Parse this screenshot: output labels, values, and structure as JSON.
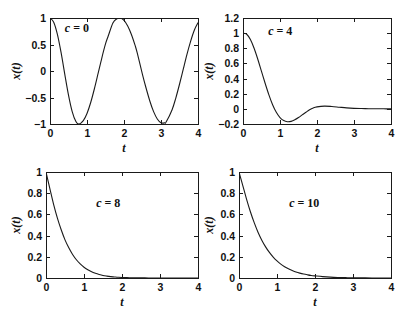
{
  "figure": {
    "background": "#ffffff",
    "curve_color": "#1a1a1a",
    "axis_color": "#1a1a1a",
    "width": 403,
    "height": 314
  },
  "chart_data": [
    {
      "type": "line",
      "title": "",
      "annotation": "c = 0",
      "annotation_var": "c",
      "annotation_rest": " = 0",
      "xlabel": "t",
      "ylabel": "x(t)",
      "xlim": [
        0,
        4
      ],
      "ylim": [
        -1,
        1
      ],
      "xticks": [
        0,
        1,
        2,
        3,
        4
      ],
      "xticklabels": [
        "0",
        "1",
        "2",
        "3",
        "4"
      ],
      "yticks": [
        -1,
        -0.5,
        0,
        0.5,
        1
      ],
      "yticklabels": [
        "-1",
        "-0.5",
        "0",
        "0.5",
        "1"
      ],
      "grid": false,
      "legend": "none",
      "series": [
        {
          "name": "x(t), c = 0",
          "description": "undamped cosine, period 1.571",
          "x": [
            0,
            0.1,
            0.2,
            0.3,
            0.4,
            0.5,
            0.6,
            0.7,
            0.785,
            0.9,
            1.0,
            1.1,
            1.2,
            1.3,
            1.4,
            1.5,
            1.571,
            1.7,
            1.8,
            1.9,
            2.0,
            2.1,
            2.2,
            2.3,
            2.356,
            2.5,
            2.6,
            2.7,
            2.8,
            2.9,
            3.0,
            3.1,
            3.142,
            3.3,
            3.4,
            3.5,
            3.6,
            3.7,
            3.8,
            3.9,
            4.0
          ],
          "y": [
            1.0,
            0.921,
            0.691,
            0.345,
            -0.063,
            -0.454,
            -0.765,
            -0.954,
            -1.0,
            -0.936,
            -0.801,
            -0.595,
            -0.335,
            -0.046,
            0.245,
            0.51,
            0.655,
            0.905,
            0.982,
            0.999,
            0.955,
            0.85,
            0.69,
            0.483,
            0.345,
            -0.067,
            -0.33,
            -0.57,
            -0.767,
            -0.905,
            -0.977,
            -0.978,
            -0.959,
            -0.73,
            -0.51,
            -0.25,
            0.03,
            0.31,
            0.56,
            0.77,
            0.91
          ]
        }
      ]
    },
    {
      "type": "line",
      "title": "",
      "annotation": "c = 4",
      "annotation_var": "c",
      "annotation_rest": " = 4",
      "xlabel": "t",
      "ylabel": "x(t)",
      "xlim": [
        0,
        4
      ],
      "ylim": [
        -0.2,
        1.2
      ],
      "xticks": [
        0,
        1,
        2,
        3,
        4
      ],
      "xticklabels": [
        "0",
        "1",
        "2",
        "3",
        "4"
      ],
      "yticks": [
        -0.2,
        0,
        0.2,
        0.4,
        0.6,
        0.8,
        1,
        1.2
      ],
      "yticklabels": [
        "-0.2",
        "0",
        "0.2",
        "0.4",
        "0.6",
        "0.8",
        "1",
        "1.2"
      ],
      "grid": false,
      "legend": "none",
      "series": [
        {
          "name": "x(t), c = 4",
          "description": "underdamped decay with one undershoot",
          "x": [
            0,
            0.1,
            0.2,
            0.3,
            0.4,
            0.5,
            0.6,
            0.7,
            0.8,
            0.9,
            1.0,
            1.1,
            1.2,
            1.3,
            1.4,
            1.5,
            1.6,
            1.7,
            1.8,
            1.9,
            2.0,
            2.2,
            2.4,
            2.6,
            2.8,
            3.0,
            3.2,
            3.4,
            3.6,
            3.8,
            4.0
          ],
          "y": [
            1.0,
            0.985,
            0.915,
            0.8,
            0.655,
            0.495,
            0.335,
            0.185,
            0.055,
            -0.045,
            -0.115,
            -0.155,
            -0.17,
            -0.165,
            -0.145,
            -0.115,
            -0.08,
            -0.045,
            -0.012,
            0.012,
            0.026,
            0.036,
            0.031,
            0.022,
            0.013,
            0.007,
            0.004,
            0.002,
            0.001,
            0.0005,
            0.0
          ]
        }
      ]
    },
    {
      "type": "line",
      "title": "",
      "annotation": "c = 8",
      "annotation_var": "c",
      "annotation_rest": " = 8",
      "xlabel": "t",
      "ylabel": "x(t)",
      "xlim": [
        0,
        4
      ],
      "ylim": [
        0,
        1
      ],
      "xticks": [
        0,
        1,
        2,
        3,
        4
      ],
      "xticklabels": [
        "0",
        "1",
        "2",
        "3",
        "4"
      ],
      "yticks": [
        0,
        0.2,
        0.4,
        0.6,
        0.8,
        1
      ],
      "yticklabels": [
        "0",
        "0.2",
        "0.4",
        "0.6",
        "0.8",
        "1"
      ],
      "grid": false,
      "legend": "none",
      "series": [
        {
          "name": "x(t), c = 8",
          "description": "critically damped monotone decay",
          "x": [
            0,
            0.1,
            0.2,
            0.3,
            0.4,
            0.5,
            0.6,
            0.7,
            0.8,
            0.9,
            1.0,
            1.1,
            1.2,
            1.3,
            1.4,
            1.5,
            1.6,
            1.7,
            1.8,
            1.9,
            2.0,
            2.2,
            2.4,
            2.6,
            2.8,
            3.0,
            3.5,
            4.0
          ],
          "y": [
            1.0,
            0.845,
            0.695,
            0.565,
            0.455,
            0.36,
            0.285,
            0.222,
            0.172,
            0.133,
            0.101,
            0.077,
            0.058,
            0.044,
            0.033,
            0.024,
            0.018,
            0.013,
            0.01,
            0.007,
            0.005,
            0.003,
            0.0015,
            0.0008,
            0.0004,
            0.0002,
            5e-05,
            0.0
          ]
        }
      ]
    },
    {
      "type": "line",
      "title": "",
      "annotation": "c = 10",
      "annotation_var": "c",
      "annotation_rest": " = 10",
      "xlabel": "t",
      "ylabel": "x(t)",
      "xlim": [
        0,
        4
      ],
      "ylim": [
        0,
        1
      ],
      "xticks": [
        0,
        1,
        2,
        3,
        4
      ],
      "xticklabels": [
        "0",
        "1",
        "2",
        "3",
        "4"
      ],
      "yticks": [
        0,
        0.2,
        0.4,
        0.6,
        0.8,
        1
      ],
      "yticklabels": [
        "0",
        "0.2",
        "0.4",
        "0.6",
        "0.8",
        "1"
      ],
      "grid": false,
      "legend": "none",
      "series": [
        {
          "name": "x(t), c = 10",
          "description": "overdamped monotone decay, slightly slower tail",
          "x": [
            0,
            0.1,
            0.2,
            0.3,
            0.4,
            0.5,
            0.6,
            0.7,
            0.8,
            0.9,
            1.0,
            1.1,
            1.2,
            1.3,
            1.4,
            1.5,
            1.6,
            1.7,
            1.8,
            1.9,
            2.0,
            2.2,
            2.4,
            2.6,
            2.8,
            3.0,
            3.5,
            4.0
          ],
          "y": [
            1.0,
            0.872,
            0.742,
            0.625,
            0.522,
            0.432,
            0.357,
            0.294,
            0.241,
            0.197,
            0.161,
            0.131,
            0.107,
            0.087,
            0.071,
            0.057,
            0.046,
            0.037,
            0.03,
            0.024,
            0.02,
            0.013,
            0.008,
            0.005,
            0.0035,
            0.002,
            0.0007,
            0.0002
          ]
        }
      ]
    }
  ]
}
